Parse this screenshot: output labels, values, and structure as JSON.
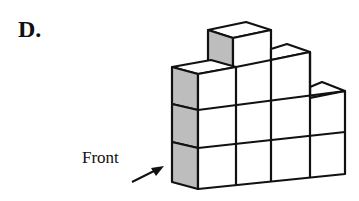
{
  "option_label": "D.",
  "front_label": "Front",
  "colors": {
    "stroke": "#111111",
    "side_shade": "#bdbdbd",
    "face": "#ffffff"
  },
  "structure": {
    "description": "Isometric stack of unit cubes viewed from front-left",
    "column_heights_left_to_right": [
      3,
      4,
      3,
      2
    ],
    "shaded_faces": "left side faces"
  }
}
